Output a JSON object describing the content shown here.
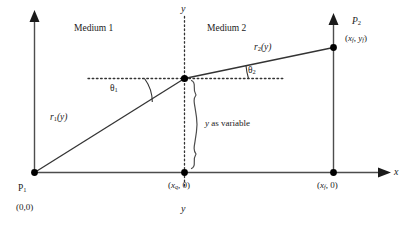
{
  "figure": {
    "colors": {
      "line": "#4d4d4d",
      "ray": "#333333",
      "text": "#1a1a1a",
      "dot": "#000000",
      "dotted": "#333333",
      "background": "#ffffff"
    },
    "media": {
      "left_label": "Medium 1",
      "right_label": "Medium 2"
    },
    "axes": {
      "x_label": "x",
      "y_label_top": "y",
      "y_label_bottom": "y"
    },
    "points": [
      {
        "name": "P1",
        "label_main": "P",
        "label_sub": "1",
        "coord_text": "(0,0)"
      },
      {
        "name": "P2",
        "label_main": "P",
        "label_sub": "2",
        "coord_open": "(",
        "coord_x": "x",
        "coord_x_sub": "f",
        "coord_sep": ", ",
        "coord_y": "y",
        "coord_y_sub": "f",
        "coord_close": ")"
      },
      {
        "name": "interface-foot",
        "coord_open": "(",
        "coord_x": "x",
        "coord_x_sub": "q",
        "coord_rest": ", 0)"
      },
      {
        "name": "final-foot",
        "coord_open": "(",
        "coord_x": "x",
        "coord_x_sub": "f",
        "coord_rest": ", 0)"
      }
    ],
    "rays": [
      {
        "name": "r1",
        "base": "r",
        "sub": "1",
        "arg": "(y)"
      },
      {
        "name": "r2",
        "base": "r",
        "sub": "2",
        "arg": "(y)"
      }
    ],
    "angles": [
      {
        "name": "theta1",
        "glyph": "θ",
        "sub": "1"
      },
      {
        "name": "theta2",
        "glyph": "θ",
        "sub": "2"
      }
    ],
    "annotation": {
      "brace_label_italic": "y",
      "brace_label_rest": " as variable"
    }
  }
}
